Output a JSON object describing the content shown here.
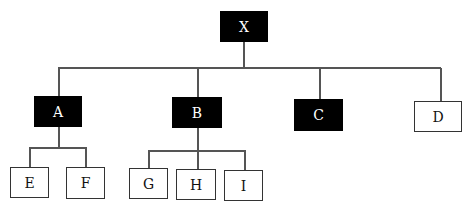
{
  "diagram": {
    "type": "tree",
    "root": "X",
    "nodes": [
      {
        "id": "X",
        "label": "X",
        "style": "filled",
        "x": 220,
        "y": 11,
        "w": 48,
        "h": 31
      },
      {
        "id": "A",
        "label": "A",
        "style": "filled",
        "x": 34,
        "y": 96,
        "w": 48,
        "h": 31
      },
      {
        "id": "B",
        "label": "B",
        "style": "filled",
        "x": 172,
        "y": 97,
        "w": 50,
        "h": 31
      },
      {
        "id": "C",
        "label": "C",
        "style": "filled",
        "x": 294,
        "y": 99,
        "w": 49,
        "h": 32
      },
      {
        "id": "D",
        "label": "D",
        "style": "outline",
        "x": 414,
        "y": 101,
        "w": 48,
        "h": 31
      },
      {
        "id": "E",
        "label": "E",
        "style": "outline",
        "x": 10,
        "y": 167,
        "w": 39,
        "h": 31
      },
      {
        "id": "F",
        "label": "F",
        "style": "outline",
        "x": 66,
        "y": 167,
        "w": 39,
        "h": 32
      },
      {
        "id": "G",
        "label": "G",
        "style": "outline",
        "x": 129,
        "y": 168,
        "w": 39,
        "h": 31
      },
      {
        "id": "H",
        "label": "H",
        "style": "outline",
        "x": 176,
        "y": 169,
        "w": 40,
        "h": 31
      },
      {
        "id": "I",
        "label": "I",
        "style": "outline",
        "x": 224,
        "y": 170,
        "w": 39,
        "h": 31
      }
    ],
    "edges": [
      [
        "X",
        "A"
      ],
      [
        "X",
        "B"
      ],
      [
        "X",
        "C"
      ],
      [
        "X",
        "D"
      ],
      [
        "A",
        "E"
      ],
      [
        "A",
        "F"
      ],
      [
        "B",
        "G"
      ],
      [
        "B",
        "H"
      ],
      [
        "B",
        "I"
      ]
    ],
    "colors": {
      "filled_bg": "#000000",
      "filled_text": "#ffffff",
      "outline_border": "#333333",
      "line": "#555555"
    }
  }
}
